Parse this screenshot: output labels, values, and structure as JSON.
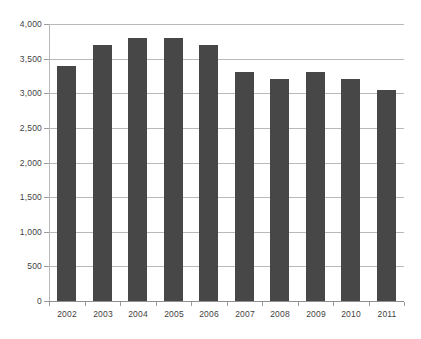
{
  "chart_data": {
    "type": "bar",
    "title": "",
    "subtitle": "",
    "xlabel": "",
    "ylabel": "",
    "categories": [
      "2002",
      "2003",
      "2004",
      "2005",
      "2006",
      "2007",
      "2008",
      "2009",
      "2010",
      "2011"
    ],
    "values": [
      3400,
      3700,
      3800,
      3800,
      3700,
      3300,
      3200,
      3300,
      3200,
      3050
    ],
    "series": [
      {
        "name": "",
        "values": [
          3400,
          3700,
          3800,
          3800,
          3700,
          3300,
          3200,
          3300,
          3200,
          3050
        ]
      }
    ],
    "ylim": [
      0,
      4000
    ],
    "ytick_values": [
      0,
      500,
      1000,
      1500,
      2000,
      2500,
      3000,
      3500,
      4000
    ],
    "ytick_labels": [
      "0",
      "500",
      "1,000",
      "1,500",
      "2,000",
      "2,500",
      "3,000",
      "3,500",
      "4,000"
    ],
    "grid": true,
    "grid_axis": "y",
    "legend": false,
    "legend_position": "none",
    "annotations": [],
    "colors": {
      "bar": "#474747",
      "gridline": "#b9b9b9",
      "axis": "#9a9a9a",
      "text": "#3f3f3f",
      "background": "#ffffff"
    }
  }
}
